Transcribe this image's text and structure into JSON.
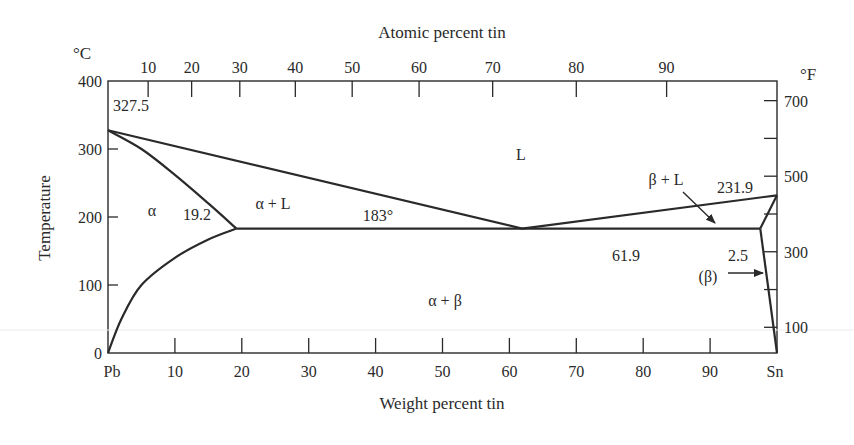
{
  "chart_data": {
    "type": "line",
    "xlabel": "Weight percent tin",
    "x2label": "Atomic percent tin",
    "ylabel": "Temperature",
    "y_unit_left": "°C",
    "y_unit_right": "°F",
    "xlim": [
      0,
      100
    ],
    "ylim": [
      0,
      400
    ],
    "x_ticks": [
      {
        "value": 0,
        "label": "Pb"
      },
      {
        "value": 10,
        "label": "10"
      },
      {
        "value": 20,
        "label": "20"
      },
      {
        "value": 30,
        "label": "30"
      },
      {
        "value": 40,
        "label": "40"
      },
      {
        "value": 50,
        "label": "50"
      },
      {
        "value": 60,
        "label": "60"
      },
      {
        "value": 70,
        "label": "70"
      },
      {
        "value": 80,
        "label": "80"
      },
      {
        "value": 90,
        "label": "90"
      },
      {
        "value": 100,
        "label": "Sn"
      }
    ],
    "x2_ticks": [
      {
        "wt": 6.0,
        "label": "10"
      },
      {
        "wt": 12.5,
        "label": "20"
      },
      {
        "wt": 19.7,
        "label": "30"
      },
      {
        "wt": 28.0,
        "label": "40"
      },
      {
        "wt": 36.5,
        "label": "50"
      },
      {
        "wt": 46.5,
        "label": "60"
      },
      {
        "wt": 57.5,
        "label": "70"
      },
      {
        "wt": 70.0,
        "label": "80"
      },
      {
        "wt": 83.5,
        "label": "90"
      }
    ],
    "y_ticks_left": [
      0,
      100,
      200,
      300,
      400
    ],
    "y_ticks_right": [
      {
        "tempC": 37.8,
        "label": "100"
      },
      {
        "tempC": 93.3,
        "label": ""
      },
      {
        "tempC": 148.9,
        "label": "300"
      },
      {
        "tempC": 204.4,
        "label": ""
      },
      {
        "tempC": 260.0,
        "label": "500"
      },
      {
        "tempC": 315.6,
        "label": ""
      },
      {
        "tempC": 371.1,
        "label": "700"
      }
    ],
    "series": [
      {
        "name": "liquidus-left",
        "points": [
          [
            0,
            327.5
          ],
          [
            61.9,
            183
          ]
        ]
      },
      {
        "name": "liquidus-right",
        "points": [
          [
            61.9,
            183
          ],
          [
            100,
            231.9
          ]
        ]
      },
      {
        "name": "alpha-solidus",
        "points": [
          [
            0,
            327.5
          ],
          [
            5,
            300
          ],
          [
            10,
            262
          ],
          [
            15,
            220
          ],
          [
            19.2,
            183
          ]
        ]
      },
      {
        "name": "alpha-solvus",
        "points": [
          [
            0,
            0
          ],
          [
            2,
            50
          ],
          [
            5,
            100
          ],
          [
            10,
            140
          ],
          [
            15,
            167
          ],
          [
            19.2,
            183
          ]
        ]
      },
      {
        "name": "eutectic-isotherm",
        "points": [
          [
            19.2,
            183
          ],
          [
            97.5,
            183
          ]
        ]
      },
      {
        "name": "beta-solidus",
        "points": [
          [
            97.5,
            183
          ],
          [
            100,
            231.9
          ]
        ]
      },
      {
        "name": "beta-solvus",
        "points": [
          [
            97.5,
            183
          ],
          [
            100,
            0
          ]
        ]
      }
    ],
    "annotations": [
      {
        "text": "327.5",
        "x": 0,
        "y": 327.5
      },
      {
        "text": "L",
        "x": 62,
        "y": 295
      },
      {
        "text": "α",
        "x": 6.5,
        "y": 210
      },
      {
        "text": "19.2",
        "x": 13,
        "y": 200
      },
      {
        "text": "α + L",
        "x": 29,
        "y": 218
      },
      {
        "text": "183°",
        "x": 41,
        "y": 200
      },
      {
        "text": "61.9",
        "x": 61.9,
        "y": 160
      },
      {
        "text": "α + β",
        "x": 51,
        "y": 95
      },
      {
        "text": "β + L",
        "x": 84,
        "y": 245
      },
      {
        "text": "231.9",
        "x": 94,
        "y": 240
      },
      {
        "text": "2.5",
        "x": 94,
        "y": 125
      },
      {
        "text": "(β)",
        "x": 90,
        "y": 100
      }
    ],
    "grid": false,
    "legend": "none"
  },
  "labels": {
    "top_axis_title": "Atomic percent tin",
    "bottom_axis_title": "Weight percent tin",
    "left_axis_title": "Temperature",
    "left_unit": "°C",
    "right_unit": "°F"
  }
}
